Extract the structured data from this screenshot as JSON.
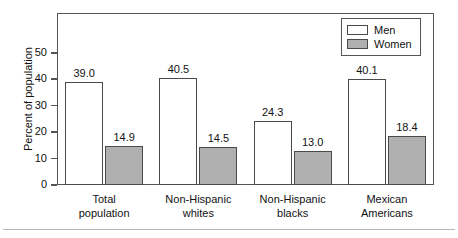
{
  "chart_data": {
    "type": "bar",
    "title": "",
    "xlabel": "",
    "ylabel": "Percent of population",
    "ylim": [
      0,
      50
    ],
    "yticks": [
      "0",
      "10",
      "20",
      "30",
      "40",
      "50"
    ],
    "grid": false,
    "legend_position": "top-right",
    "categories": [
      "Total population",
      "Non-Hispanic whites",
      "Non-Hispanic blacks",
      "Mexican Americans"
    ],
    "category_lines": [
      [
        "Total",
        "population"
      ],
      [
        "Non-Hispanic",
        "whites"
      ],
      [
        "Non-Hispanic",
        "blacks"
      ],
      [
        "Mexican",
        "Americans"
      ]
    ],
    "series": [
      {
        "name": "Men",
        "color": "#ffffff",
        "values": [
          39.0,
          40.5,
          24.3,
          40.1
        ],
        "labels": [
          "39.0",
          "40.5",
          "24.3",
          "40.1"
        ]
      },
      {
        "name": "Women",
        "color": "#b0b0b0",
        "values": [
          14.9,
          14.5,
          13.0,
          18.4
        ],
        "labels": [
          "14.9",
          "14.5",
          "13.0",
          "18.4"
        ]
      }
    ]
  },
  "legend": {
    "entries": [
      {
        "label": "Men",
        "swatch": "white-swatch"
      },
      {
        "label": "Women",
        "swatch": "gray-swatch"
      }
    ]
  },
  "colors": {
    "men_fill": "#ffffff",
    "women_fill": "#b0b0b0",
    "outline": "#4a4a4a",
    "frame": "#555555",
    "text": "#111111",
    "rule": "#b9b9b9"
  }
}
